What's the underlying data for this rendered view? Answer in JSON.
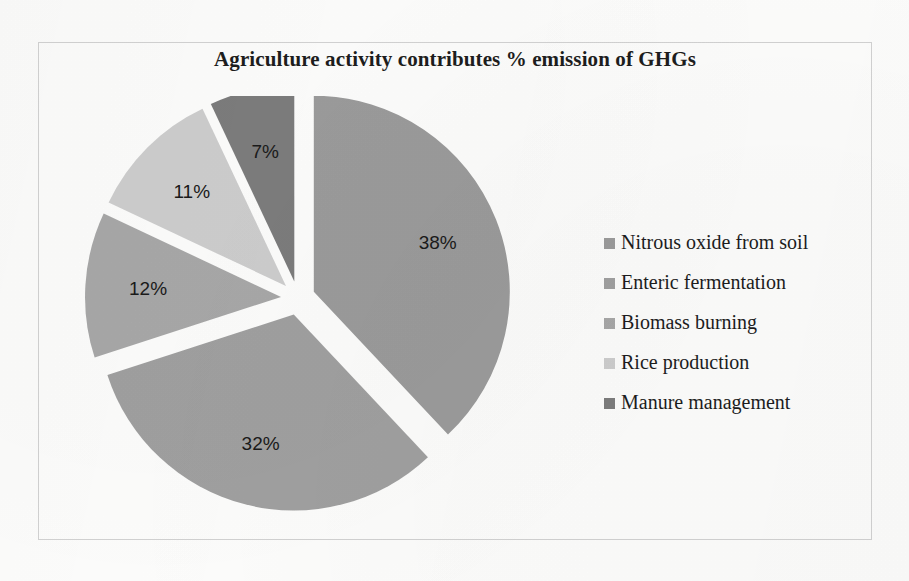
{
  "chart_data": {
    "type": "pie",
    "title": "Agriculture activity contributes % emission of GHGs",
    "xlabel": "",
    "ylabel": "",
    "legend_position": "right",
    "exploded": true,
    "units": "percent",
    "categories": [
      "Nitrous oxide from soil",
      "Enteric fermentation",
      "Biomass burning",
      "Rice production",
      "Manure management"
    ],
    "values": [
      38,
      32,
      12,
      11,
      7
    ],
    "labels": [
      "38%",
      "32%",
      "12%",
      "11%",
      "7%"
    ],
    "colors": [
      "#9b9b9b",
      "#a0a0a0",
      "#a8a8a8",
      "#cdcdcd",
      "#7c7c7c"
    ],
    "slices": [
      {
        "label": "Nitrous oxide from soil",
        "value": 38,
        "display": "38%",
        "color": "#9b9b9b"
      },
      {
        "label": "Enteric fermentation",
        "value": 32,
        "display": "32%",
        "color": "#a0a0a0"
      },
      {
        "label": "Biomass burning",
        "value": 12,
        "display": "12%",
        "color": "#a8a8a8"
      },
      {
        "label": "Rice production",
        "value": 11,
        "display": "11%",
        "color": "#cdcdcd"
      },
      {
        "label": "Manure management",
        "value": 7,
        "display": "7%",
        "color": "#7c7c7c"
      }
    ]
  },
  "legend": {
    "items": [
      {
        "label": "Nitrous oxide from soil",
        "color": "#9b9b9b"
      },
      {
        "label": "Enteric fermentation",
        "color": "#a0a0a0"
      },
      {
        "label": "Biomass burning",
        "color": "#a8a8a8"
      },
      {
        "label": "Rice production",
        "color": "#cdcdcd"
      },
      {
        "label": "Manure management",
        "color": "#7c7c7c"
      }
    ]
  }
}
